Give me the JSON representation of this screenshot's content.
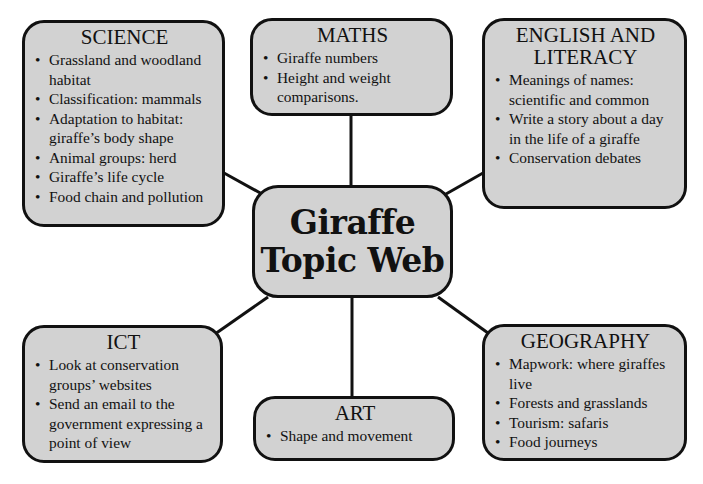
{
  "center": {
    "line1": "Giraffe",
    "line2": "Topic Web"
  },
  "nodes": {
    "science": {
      "title": "SCIENCE",
      "items": [
        "Grassland and woodland habitat",
        "Classification: mammals",
        "Adaptation to habitat: giraffe’s body shape",
        "Animal groups: herd",
        "Giraffe’s life cycle",
        "Food chain and pollution"
      ]
    },
    "maths": {
      "title": "MATHS",
      "items": [
        "Giraffe numbers",
        "Height and weight comparisons."
      ]
    },
    "english": {
      "title_line1": "ENGLISH AND",
      "title_line2": "LITERACY",
      "items": [
        "Meanings of names: scientific and common",
        "Write a story about a day in the life of a giraffe",
        "Conservation debates"
      ]
    },
    "ict": {
      "title": "ICT",
      "items": [
        "Look at conservation groups’ websites",
        "Send an email to the government expressing a point of view"
      ]
    },
    "art": {
      "title": "ART",
      "items": [
        "Shape and movement"
      ]
    },
    "geography": {
      "title": "GEOGRAPHY",
      "items": [
        "Mapwork: where giraffes live",
        "Forests and grasslands",
        "Tourism: safaris",
        "Food journeys"
      ]
    }
  },
  "colors": {
    "box_fill": "#d2d2d2",
    "border": "#111111",
    "background": "#ffffff"
  }
}
